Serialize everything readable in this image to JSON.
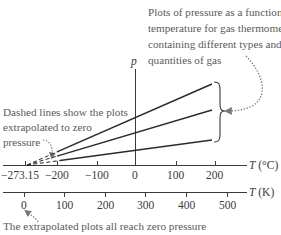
{
  "annotations": {
    "top_right": {
      "lines": [
        "Plots of pressure as a function of",
        "temperature for gas thermometers",
        "containing different types and",
        "quantities of gas"
      ]
    },
    "left": {
      "lines": [
        "Dashed lines show the plots",
        "extrapolated to zero",
        "pressure"
      ]
    },
    "bottom": {
      "text": "The extrapolated plots all reach zero pressure"
    }
  },
  "axes": {
    "p_axis": {
      "label": "p"
    },
    "celsius": {
      "label_var": "T",
      "label_unit": "(°C)",
      "ticks": [
        "−273.15",
        "−200",
        "−100",
        "0",
        "100",
        "200"
      ]
    },
    "kelvin": {
      "label_var": "T",
      "label_unit": "(K)",
      "ticks": [
        "0",
        "100",
        "200",
        "300",
        "400",
        "500"
      ]
    }
  },
  "colors": {
    "line": "#2b2b2b",
    "annotation_text": "#5a5a5a",
    "axis": "#3a3a3a"
  },
  "series": [
    {
      "name": "gas-1",
      "end_y_px": 84
    },
    {
      "name": "gas-2",
      "end_y_px": 110
    },
    {
      "name": "gas-3",
      "end_y_px": 140
    }
  ]
}
